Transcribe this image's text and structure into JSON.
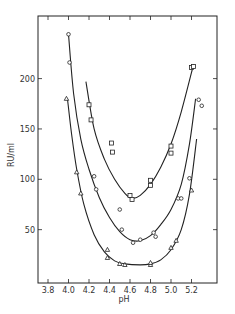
{
  "chart_data": {
    "type": "scatter",
    "title": "",
    "xlabel": "pH",
    "ylabel": "RU/ml",
    "xlim": [
      3.7,
      5.45
    ],
    "ylim": [
      0,
      262
    ],
    "xticks": [
      3.8,
      4.0,
      4.2,
      4.4,
      4.6,
      4.8,
      5.0,
      5.2
    ],
    "xtick_labels": [
      "3.8",
      "4.0",
      "4.2",
      "4.4",
      "4.6",
      "4.8",
      "5.0",
      "5.2"
    ],
    "yticks": [
      50,
      100,
      150,
      200
    ],
    "ytick_labels": [
      "50",
      "100",
      "150",
      "200"
    ],
    "grid": false,
    "legend": null,
    "series": [
      {
        "name": "squares",
        "marker": "square",
        "points": [
          [
            4.2,
            174
          ],
          [
            4.22,
            159
          ],
          [
            4.42,
            136
          ],
          [
            4.43,
            127
          ],
          [
            4.6,
            84
          ],
          [
            4.62,
            80
          ],
          [
            4.8,
            99
          ],
          [
            4.8,
            94
          ],
          [
            5.0,
            133
          ],
          [
            5.0,
            126
          ],
          [
            5.2,
            211
          ],
          [
            5.22,
            212
          ]
        ],
        "curve": [
          [
            4.17,
            197
          ],
          [
            4.25,
            150
          ],
          [
            4.35,
            120
          ],
          [
            4.45,
            100
          ],
          [
            4.55,
            86
          ],
          [
            4.62,
            81
          ],
          [
            4.7,
            84
          ],
          [
            4.8,
            95
          ],
          [
            4.9,
            112
          ],
          [
            5.0,
            135
          ],
          [
            5.1,
            167
          ],
          [
            5.22,
            214
          ]
        ]
      },
      {
        "name": "circles",
        "marker": "circle",
        "points": [
          [
            4.0,
            244
          ],
          [
            4.01,
            216
          ],
          [
            4.25,
            103
          ],
          [
            4.27,
            90
          ],
          [
            4.5,
            70
          ],
          [
            4.52,
            50
          ],
          [
            4.63,
            37
          ],
          [
            4.7,
            40
          ],
          [
            4.83,
            47
          ],
          [
            4.85,
            43
          ],
          [
            5.07,
            81
          ],
          [
            5.1,
            81
          ],
          [
            5.18,
            101
          ],
          [
            5.27,
            179
          ],
          [
            5.3,
            173
          ]
        ],
        "curve": [
          [
            4.0,
            244
          ],
          [
            4.05,
            185
          ],
          [
            4.12,
            140
          ],
          [
            4.2,
            110
          ],
          [
            4.3,
            82
          ],
          [
            4.4,
            62
          ],
          [
            4.5,
            48
          ],
          [
            4.6,
            40
          ],
          [
            4.7,
            39
          ],
          [
            4.8,
            44
          ],
          [
            4.9,
            55
          ],
          [
            5.0,
            70
          ],
          [
            5.1,
            95
          ],
          [
            5.18,
            135
          ],
          [
            5.24,
            180
          ]
        ]
      },
      {
        "name": "triangles",
        "marker": "triangle",
        "points": [
          [
            3.98,
            180
          ],
          [
            4.08,
            107
          ],
          [
            4.12,
            86
          ],
          [
            4.38,
            30
          ],
          [
            4.38,
            22
          ],
          [
            4.5,
            16
          ],
          [
            4.55,
            15
          ],
          [
            4.8,
            15
          ],
          [
            4.8,
            17
          ],
          [
            5.0,
            32
          ],
          [
            5.05,
            39
          ],
          [
            5.2,
            89
          ]
        ],
        "curve": [
          [
            3.99,
            180
          ],
          [
            4.03,
            145
          ],
          [
            4.08,
            110
          ],
          [
            4.15,
            75
          ],
          [
            4.25,
            45
          ],
          [
            4.35,
            28
          ],
          [
            4.45,
            19
          ],
          [
            4.55,
            16
          ],
          [
            4.7,
            15
          ],
          [
            4.8,
            16
          ],
          [
            4.9,
            20
          ],
          [
            5.0,
            30
          ],
          [
            5.1,
            50
          ],
          [
            5.18,
            85
          ],
          [
            5.25,
            140
          ]
        ]
      }
    ]
  }
}
